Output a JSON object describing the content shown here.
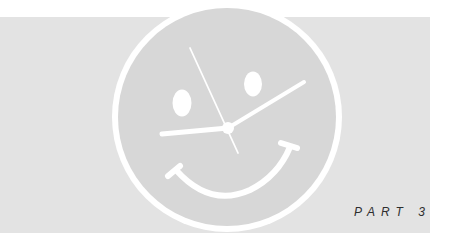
{
  "illustration": {
    "subject": "smiley-face-clock",
    "colors": {
      "background": "#ffffff",
      "banner": "#e3e3e3",
      "face": "#d7d7d7",
      "strokes": "#ffffff",
      "label": "#2e2e2e"
    }
  },
  "section": {
    "label": "PART 3"
  }
}
